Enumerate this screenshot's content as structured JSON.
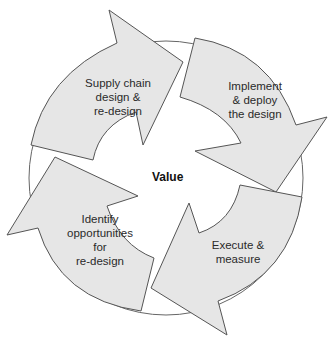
{
  "diagram": {
    "type": "cycle",
    "center_label": "Value",
    "colors": {
      "arrow_fill": "#e6e6e6",
      "stroke": "#555555",
      "background": "#ffffff"
    },
    "steps": [
      {
        "id": "design",
        "label": "Supply chain\ndesign &\nre-design"
      },
      {
        "id": "implement",
        "label": "Implement\n& deploy\nthe design"
      },
      {
        "id": "execute",
        "label": "Execute &\nmeasure"
      },
      {
        "id": "identify",
        "label": "Identify\nopportunities\nfor\nre-design"
      }
    ]
  }
}
